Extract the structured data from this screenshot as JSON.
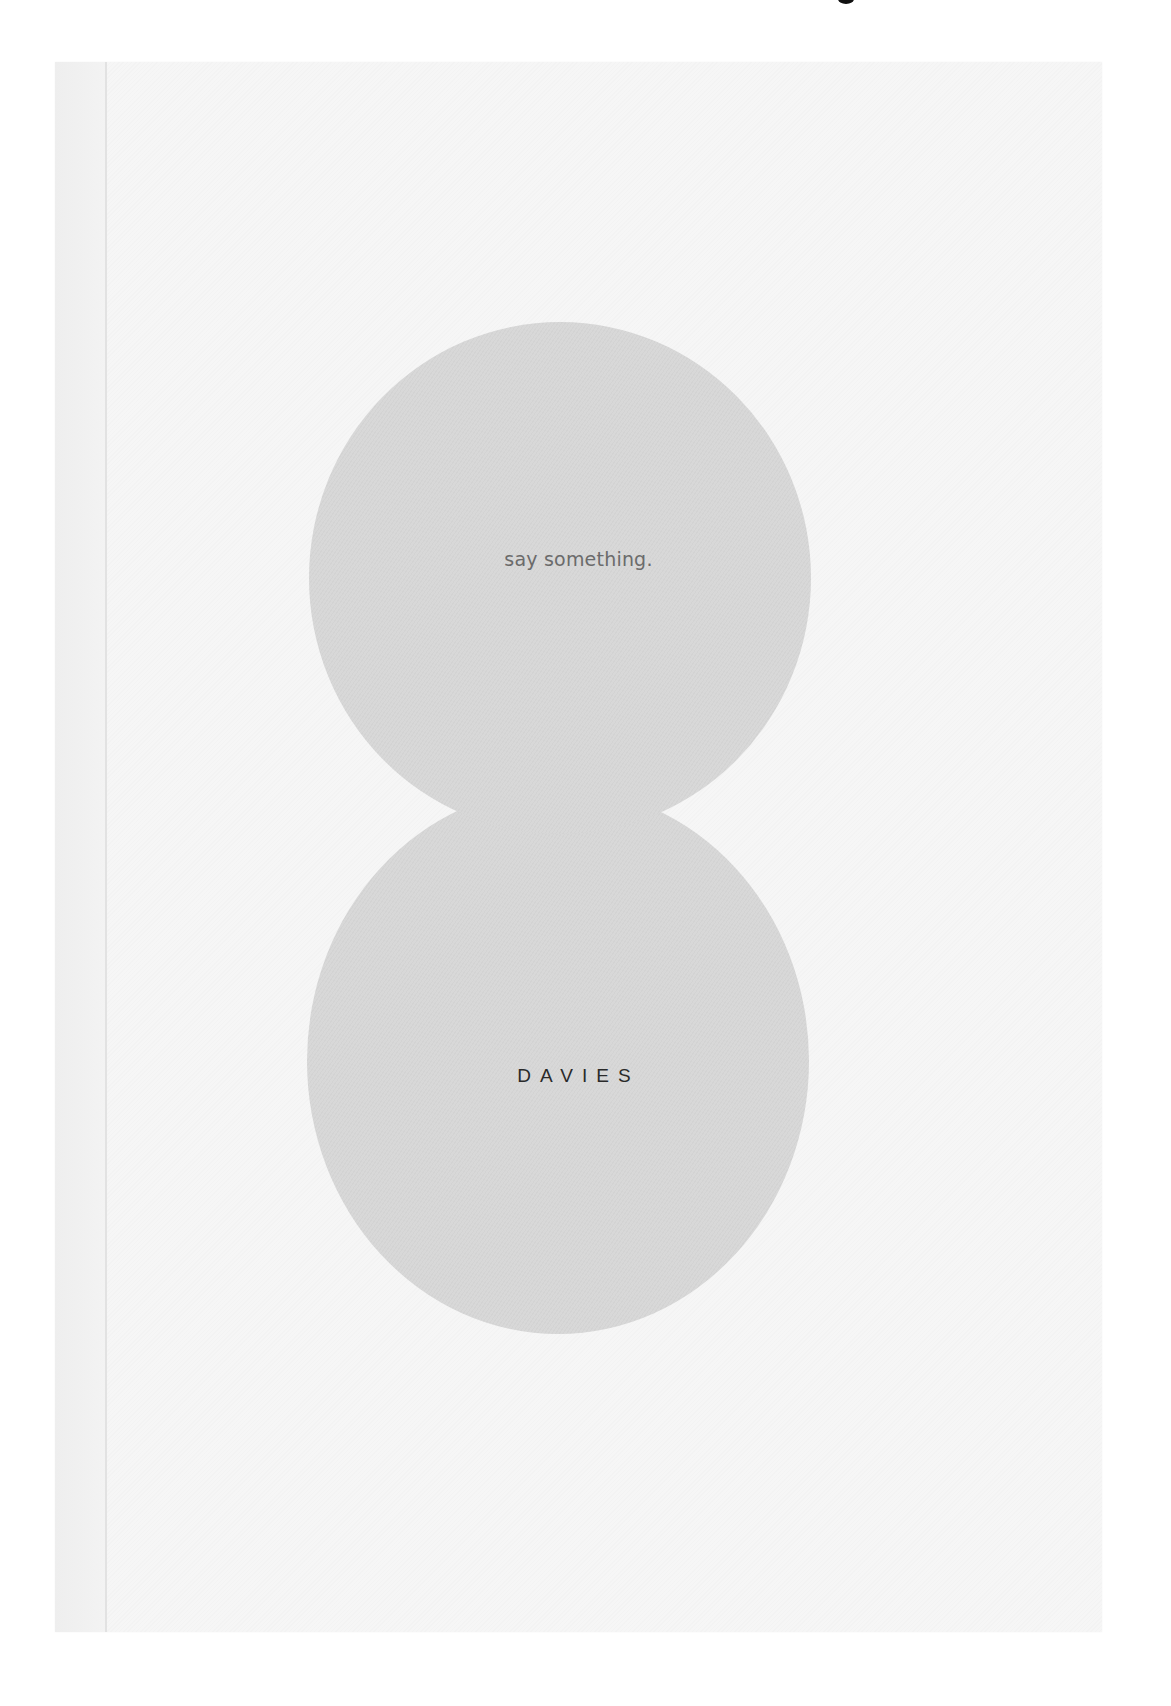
{
  "poster": {
    "tagline": "say something.",
    "brand": "DAVIES",
    "colors": {
      "background": "#ffffff",
      "paper": "#f6f6f6",
      "circles": "#d8d8d8",
      "tagline_text": "#6b6b6b",
      "brand_text": "#2a2a2a"
    }
  }
}
